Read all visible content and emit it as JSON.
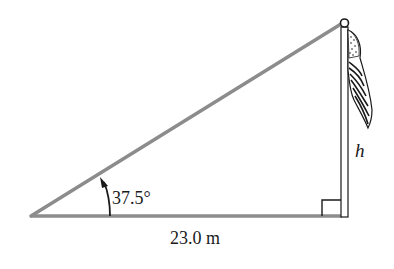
{
  "diagram": {
    "type": "right-triangle-flagpole",
    "angle_label": "37.5°",
    "base_label": "23.0 m",
    "height_label": "h",
    "colors": {
      "triangle_line": "#8c8c8c",
      "ink": "#1a1a1a",
      "background": "#ffffff"
    },
    "elements": [
      "hypotenuse",
      "base",
      "flagpole",
      "flag",
      "right-angle-marker",
      "angle-arc-arrow"
    ]
  }
}
